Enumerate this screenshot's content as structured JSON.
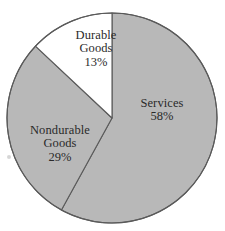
{
  "figure": {
    "background_color": "#ffffff",
    "top_cut_text": "",
    "center_x": 112,
    "center_y": 118,
    "radius": 105
  },
  "chart_data": {
    "type": "pie",
    "title": "",
    "xlabel": "",
    "ylabel": "",
    "legend_position": "none",
    "grid": false,
    "start_angle_deg": 0,
    "direction": "clockwise",
    "categories": [
      "Services",
      "Nondurable Goods",
      "Durable Goods"
    ],
    "values": [
      58,
      29,
      13
    ],
    "unit": "%",
    "colors": [
      "#b8b8b8",
      "#b8b8b8",
      "#ffffff"
    ],
    "outline_color": "#5a5a5a",
    "slices": [
      {
        "label": "Services",
        "value_label": "58%",
        "value": 58,
        "color": "#b8b8b8",
        "start_deg": 0,
        "end_deg": 208.8
      },
      {
        "label": "Nondurable\nGoods",
        "label_line1": "Nondurable",
        "label_line2": "Goods",
        "value_label": "29%",
        "value": 29,
        "color": "#b8b8b8",
        "start_deg": 208.8,
        "end_deg": 313.2
      },
      {
        "label": "Durable\nGoods",
        "label_line1": "Durable",
        "label_line2": "Goods",
        "value_label": "13%",
        "value": 13,
        "color": "#ffffff",
        "start_deg": 313.2,
        "end_deg": 360
      }
    ]
  },
  "labels": {
    "durable": {
      "line1": "Durable",
      "line2": "Goods",
      "value": "13%"
    },
    "services": {
      "line1": "Services",
      "line2": "",
      "value": "58%"
    },
    "nondurable": {
      "line1": "Nondurable",
      "line2": "Goods",
      "value": "29%"
    }
  }
}
